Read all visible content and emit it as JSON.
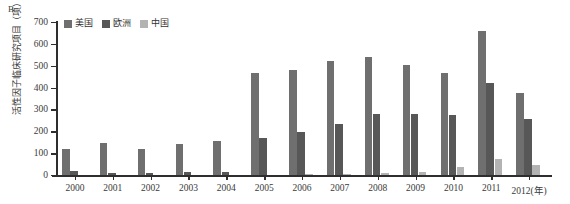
{
  "panel": {
    "label": "B"
  },
  "chart_data": {
    "type": "bar",
    "title": "",
    "subtitle": "",
    "xlabel": "(年)",
    "ylabel": "活性因子临床研究项目（项）",
    "categories": [
      "2000",
      "2001",
      "2002",
      "2003",
      "2004",
      "2005",
      "2006",
      "2007",
      "2008",
      "2009",
      "2010",
      "2011",
      "2012"
    ],
    "xtick_labels": [
      "2000",
      "2001",
      "2002",
      "2003",
      "2004",
      "2005",
      "2006",
      "2007",
      "2008",
      "2009",
      "2010",
      "2011",
      "2012(年)"
    ],
    "ylim": [
      0,
      700
    ],
    "yticks": [
      0,
      100,
      200,
      300,
      400,
      500,
      600,
      700
    ],
    "ytick_labels": [
      "0",
      "100",
      "200",
      "300",
      "400",
      "500",
      "600",
      "700"
    ],
    "grid": false,
    "legend_position": "top-left",
    "series": [
      {
        "name": "美国",
        "color": "#6f6f6f",
        "values": [
          120,
          145,
          118,
          140,
          155,
          465,
          480,
          520,
          540,
          505,
          465,
          660,
          375
        ]
      },
      {
        "name": "欧洲",
        "color": "#575757",
        "values": [
          20,
          10,
          8,
          12,
          15,
          170,
          195,
          235,
          280,
          280,
          275,
          420,
          255
        ]
      },
      {
        "name": "中国",
        "color": "#b3b3b3",
        "values": [
          0,
          0,
          0,
          0,
          0,
          0,
          5,
          5,
          10,
          15,
          35,
          75,
          45
        ]
      }
    ]
  }
}
